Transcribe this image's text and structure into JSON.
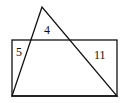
{
  "diagram": {
    "type": "overlapping-shapes",
    "shapes": {
      "rectangle": {
        "x": 12,
        "y": 40,
        "width": 105,
        "height": 56
      },
      "triangle": {
        "points": [
          [
            42,
            7
          ],
          [
            12,
            96
          ],
          [
            117,
            96
          ]
        ]
      }
    },
    "labels": [
      {
        "text": "5",
        "x": 16,
        "y": 56,
        "region": "rectangle-only-left"
      },
      {
        "text": "4",
        "x": 44,
        "y": 34,
        "region": "triangle-only-top"
      },
      {
        "text": "11",
        "x": 94,
        "y": 59,
        "region": "rectangle-only-right"
      }
    ],
    "stroke_color": "#111111",
    "background": "#ffffff"
  }
}
